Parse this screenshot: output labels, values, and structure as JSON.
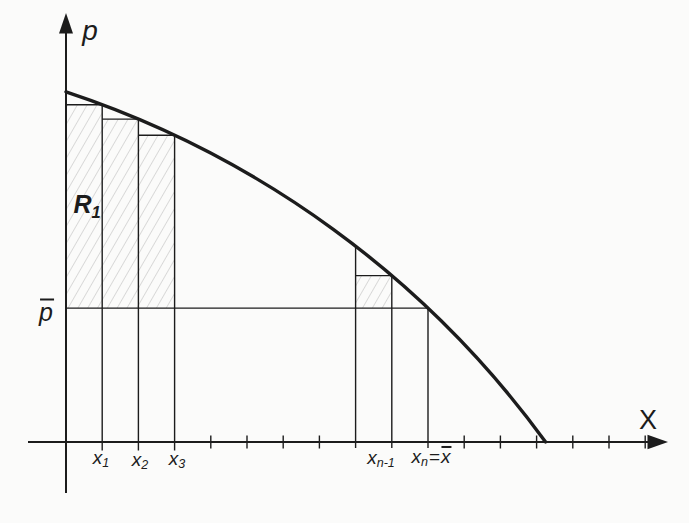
{
  "figure": {
    "type": "riemann-sum-under-demand-curve",
    "curve": "starts on p-axis, decreasing and concave, meets x-axis right of x-bar",
    "price_level": "p-bar horizontal line from p-axis to curve at x_n",
    "hatched_regions": [
      "staircase of rectangles from 0 to x3 above p-bar (labeled R1)",
      "small rectangle from x(n-2) to x(n-1) above p-bar"
    ],
    "ink_color": "#1c1c1c",
    "hatch_color": "#b8b8b8",
    "background": "#fbfbfa"
  },
  "labels": {
    "y_axis": "p",
    "x_axis": "X",
    "price_bar": {
      "base": "p"
    },
    "region": {
      "base": "R",
      "sub": "1"
    },
    "x1": {
      "base": "x",
      "sub": "1"
    },
    "x2": {
      "base": "x",
      "sub": "2"
    },
    "x3": {
      "base": "x",
      "sub": "3"
    },
    "xn_minus_1": {
      "base": "x",
      "sub": "n-1"
    },
    "xn": {
      "base": "x",
      "sub": "n"
    },
    "equals": "=",
    "x_bar": {
      "base": "x"
    }
  }
}
